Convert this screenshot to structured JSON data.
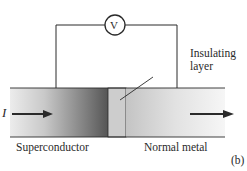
{
  "diagram": {
    "meter_label": "V",
    "current_label": "I",
    "insulating_label_line1": "Insulating",
    "insulating_label_line2": "layer",
    "left_material": "Superconductor",
    "right_material": "Normal metal",
    "panel_label": "(b)"
  },
  "colors": {
    "ink": "#2a2a2a",
    "superconductor_light": "#e6e6e6",
    "superconductor_dark": "#5a5a5a",
    "insulator": "#cfcfcf",
    "normal_metal_left": "#c8c8c8",
    "normal_metal_right": "#f4f4f4"
  }
}
